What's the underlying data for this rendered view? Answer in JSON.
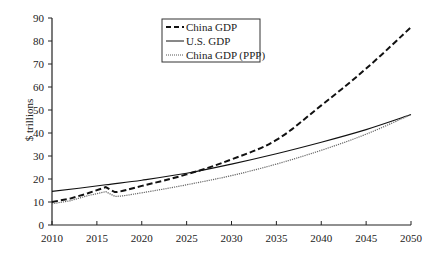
{
  "chart_data": {
    "type": "line",
    "title": "",
    "xlabel": "",
    "ylabel": "$ trillions",
    "xlim": [
      2010,
      2050
    ],
    "ylim": [
      0,
      90
    ],
    "grid": false,
    "legend_position": "top-center (inside plot, boxed)",
    "x_ticks": [
      2010,
      2015,
      2020,
      2025,
      2030,
      2035,
      2040,
      2045,
      2050
    ],
    "y_ticks": [
      0,
      10,
      20,
      30,
      40,
      50,
      60,
      70,
      80,
      90
    ],
    "series": [
      {
        "name": "China GDP",
        "style": "dashed",
        "points": [
          [
            2010,
            10
          ],
          [
            2012,
            11.5
          ],
          [
            2014,
            13.8
          ],
          [
            2016,
            16.5
          ],
          [
            2017,
            14.3
          ],
          [
            2020,
            17
          ],
          [
            2025,
            22
          ],
          [
            2030,
            28.5
          ],
          [
            2035,
            37
          ],
          [
            2040,
            52
          ],
          [
            2045,
            68
          ],
          [
            2050,
            86
          ]
        ]
      },
      {
        "name": "U.S. GDP",
        "style": "solid",
        "points": [
          [
            2010,
            14.6
          ],
          [
            2013,
            16
          ],
          [
            2016,
            17.5
          ],
          [
            2020,
            19.5
          ],
          [
            2025,
            22.5
          ],
          [
            2030,
            26.5
          ],
          [
            2035,
            31
          ],
          [
            2040,
            36
          ],
          [
            2045,
            41.5
          ],
          [
            2050,
            48
          ]
        ]
      },
      {
        "name": "China GDP (PPP)",
        "style": "dotted",
        "points": [
          [
            2010,
            9.2
          ],
          [
            2012,
            10.5
          ],
          [
            2014,
            12.8
          ],
          [
            2016,
            14.5
          ],
          [
            2017,
            12.5
          ],
          [
            2020,
            14
          ],
          [
            2025,
            17.5
          ],
          [
            2030,
            21.5
          ],
          [
            2035,
            26.5
          ],
          [
            2040,
            32.5
          ],
          [
            2045,
            39.5
          ],
          [
            2050,
            48
          ]
        ]
      }
    ]
  },
  "legend": {
    "items": [
      "China GDP",
      "U.S. GDP",
      "China GDP (PPP)"
    ]
  },
  "axis": {
    "ylabel": "$ trillions"
  }
}
